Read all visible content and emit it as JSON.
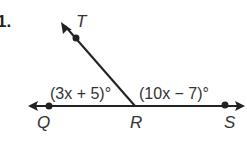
{
  "problem_number": "1.",
  "points": {
    "T": "T",
    "Q": "Q",
    "R": "R",
    "S": "S"
  },
  "angles": {
    "left": "(3x + 5)°",
    "right": "(10x − 7)°"
  },
  "colors": {
    "line": "#222222",
    "text": "#333333"
  }
}
